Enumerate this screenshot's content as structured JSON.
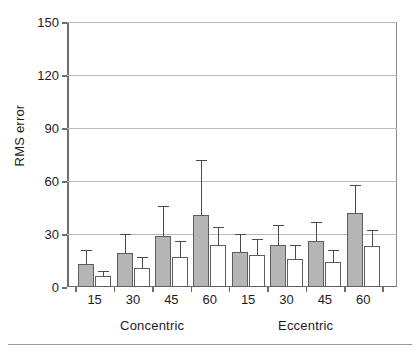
{
  "chart_data": {
    "type": "bar",
    "title": "",
    "xlabel": "",
    "ylabel": "RMS error",
    "ylim": [
      0,
      150
    ],
    "yticks": [
      0,
      30,
      60,
      90,
      120,
      150
    ],
    "grid": true,
    "legend": "none",
    "categories": [
      "15",
      "30",
      "45",
      "60",
      "15",
      "30",
      "45",
      "60"
    ],
    "group_labels": [
      "Concentric",
      "Eccentric"
    ],
    "group_spans": [
      [
        0,
        3
      ],
      [
        4,
        7
      ]
    ],
    "series": [
      {
        "name": "gray",
        "fill": "#b5b5b5",
        "values": [
          13,
          19,
          29,
          41,
          20,
          24,
          26,
          42
        ],
        "errors_upper": [
          21,
          30,
          46,
          72,
          30,
          35,
          37,
          58
        ]
      },
      {
        "name": "white",
        "fill": "#ffffff",
        "values": [
          6,
          11,
          17,
          24,
          18,
          16,
          14,
          23
        ],
        "errors_upper": [
          9,
          17,
          26,
          34,
          27,
          24,
          21,
          32
        ]
      }
    ]
  },
  "axis": {
    "y_tick_labels": [
      "0",
      "30",
      "60",
      "90",
      "120",
      "150"
    ],
    "y_axis_title": "RMS error"
  }
}
